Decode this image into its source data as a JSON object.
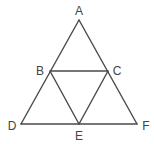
{
  "diagram": {
    "type": "geometry",
    "colors": {
      "stroke": "#4a4a4a",
      "label": "#444444",
      "background": "#ffffff"
    },
    "points": {
      "A": {
        "label": "A",
        "x": 79,
        "y": 20,
        "lx": 79,
        "ly": 15
      },
      "B": {
        "label": "B",
        "x": 50,
        "y": 71,
        "lx": 40,
        "ly": 75
      },
      "C": {
        "label": "C",
        "x": 108,
        "y": 71,
        "lx": 117,
        "ly": 75
      },
      "D": {
        "label": "D",
        "x": 21,
        "y": 124,
        "lx": 12,
        "ly": 130
      },
      "E": {
        "label": "E",
        "x": 79,
        "y": 124,
        "lx": 79,
        "ly": 140
      },
      "F": {
        "label": "F",
        "x": 137,
        "y": 124,
        "lx": 146,
        "ly": 130
      }
    },
    "segments": [
      [
        "A",
        "D"
      ],
      [
        "A",
        "F"
      ],
      [
        "D",
        "F"
      ],
      [
        "B",
        "C"
      ],
      [
        "B",
        "E"
      ],
      [
        "C",
        "E"
      ]
    ]
  }
}
